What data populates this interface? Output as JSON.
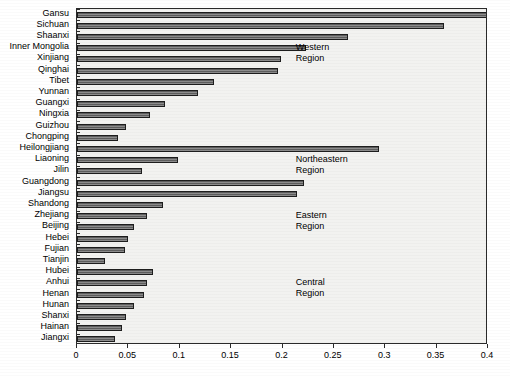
{
  "chart_data": {
    "type": "bar",
    "orientation": "horizontal",
    "title": "",
    "xlabel": "",
    "ylabel": "",
    "xlim": [
      0,
      0.4
    ],
    "xticks": [
      "0",
      "0.05",
      "0.1",
      "0.15",
      "0.2",
      "0.25",
      "0.3",
      "0.35",
      "0.4"
    ],
    "xtick_values": [
      0,
      0.05,
      0.1,
      0.15,
      0.2,
      0.25,
      0.3,
      0.35,
      0.4
    ],
    "grid": false,
    "legend": "none",
    "categories": [
      "Gansu",
      "Sichuan",
      "Shaanxi",
      "Inner Mongolia",
      "Xinjiang",
      "Qinghai",
      "Tibet",
      "Yunnan",
      "Guangxi",
      "Ningxia",
      "Guizhou",
      "Chongping",
      "Heilongjiang",
      "Liaoning",
      "Jilin",
      "Guangdong",
      "Jiangsu",
      "Shandong",
      "Zhejiang",
      "Beijing",
      "Hebei",
      "Fujian",
      "Tianjin",
      "Hubei",
      "Anhui",
      "Henan",
      "Hunan",
      "Shanxi",
      "Hainan",
      "Jiangxi"
    ],
    "values": [
      0.4,
      0.357,
      0.264,
      0.223,
      0.199,
      0.196,
      0.133,
      0.118,
      0.086,
      0.071,
      0.048,
      0.04,
      0.294,
      0.098,
      0.063,
      0.221,
      0.214,
      0.084,
      0.068,
      0.055,
      0.05,
      0.047,
      0.027,
      0.074,
      0.068,
      0.065,
      0.055,
      0.048,
      0.044,
      0.037
    ],
    "annotations": [
      {
        "text_line1": "Western",
        "text_line2": "Region",
        "x": 0.213,
        "category_index": 3
      },
      {
        "text_line1": "Northeastern",
        "text_line2": "Region",
        "x": 0.213,
        "category_index": 13
      },
      {
        "text_line1": "Eastern",
        "text_line2": "Region",
        "x": 0.213,
        "category_index": 18
      },
      {
        "text_line1": "Central",
        "text_line2": "Region",
        "x": 0.213,
        "category_index": 24
      }
    ],
    "colors": {
      "bar_fill": "#7a7a7a",
      "bar_edge": "#1d1d1d",
      "plot_background": "#f2f2f0",
      "axis": "#2a2a2a",
      "text": "#000000"
    }
  }
}
